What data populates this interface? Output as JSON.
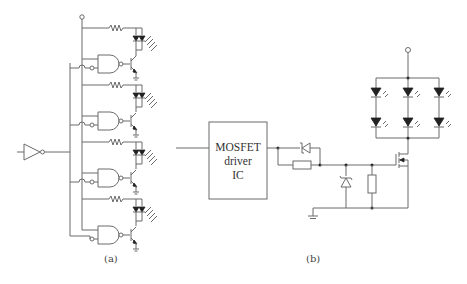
{
  "figure": {
    "panel_a": {
      "label": "(a)",
      "description": "Inverter feeding four NAND-gate transistor LED driver stages",
      "stages": 4
    },
    "panel_b": {
      "label": "(b)",
      "ic_box": {
        "line1": "MOSFET",
        "line2": "driver",
        "line3": "IC"
      },
      "led_array": {
        "columns": 3,
        "rows": 2
      }
    }
  },
  "colors": {
    "wire": "#6b6b6b",
    "fill": "#222222",
    "background": "#ffffff"
  }
}
